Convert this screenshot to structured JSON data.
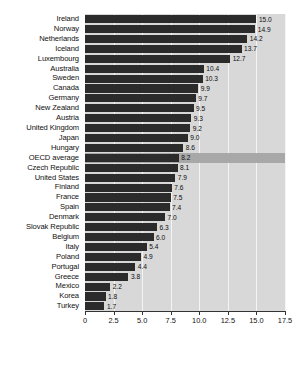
{
  "chart_data": {
    "type": "bar",
    "orientation": "horizontal",
    "title": "",
    "subtitle": "",
    "xlabel": "",
    "ylabel": "",
    "xlim": [
      0,
      17.5
    ],
    "grid": true,
    "legend": null,
    "highlight_category": "OECD average",
    "colors": {
      "bar": "#2b2b2b",
      "plot_background": "#d8d8d8",
      "gridline": "#f4f4f4",
      "highlight_band": "#a8a8a8",
      "axis": "#333333",
      "text": "#111111"
    },
    "xticks": [
      0,
      2.5,
      5.0,
      7.5,
      10.0,
      12.5,
      15.0,
      17.5
    ],
    "xtick_labels": [
      "0",
      "2.5",
      "5.0",
      "7.5",
      "10.0",
      "12.5",
      "15.0",
      "17.5"
    ],
    "categories": [
      "Ireland",
      "Norway",
      "Netherlands",
      "Iceland",
      "Luxembourg",
      "Australia",
      "Sweden",
      "Canada",
      "Germany",
      "New Zealand",
      "Austria",
      "United Kingdom",
      "Japan",
      "Hungary",
      "OECD average",
      "Czech Republic",
      "United States",
      "Finland",
      "France",
      "Spain",
      "Denmark",
      "Slovak Republic",
      "Belgium",
      "Italy",
      "Poland",
      "Portugal",
      "Greece",
      "Mexico",
      "Korea",
      "Turkey"
    ],
    "values": [
      15.0,
      14.9,
      14.2,
      13.7,
      12.7,
      10.4,
      10.3,
      9.9,
      9.7,
      9.5,
      9.3,
      9.2,
      9.0,
      8.6,
      8.2,
      8.1,
      7.9,
      7.6,
      7.5,
      7.4,
      7.0,
      6.3,
      6.0,
      5.4,
      4.9,
      4.4,
      3.8,
      2.2,
      1.8,
      1.7
    ],
    "value_labels": [
      "15.0",
      "14.9",
      "14.2",
      "13.7",
      "12.7",
      "10.4",
      "10.3",
      "9.9",
      "9.7",
      "9.5",
      "9.3",
      "9.2",
      "9.0",
      "8.6",
      "8.2",
      "8.1",
      "7.9",
      "7.6",
      "7.5",
      "7.4",
      "7.0",
      "6.3",
      "6.0",
      "5.4",
      "4.9",
      "4.4",
      "3.8",
      "2.2",
      "1.8",
      "1.7"
    ]
  }
}
